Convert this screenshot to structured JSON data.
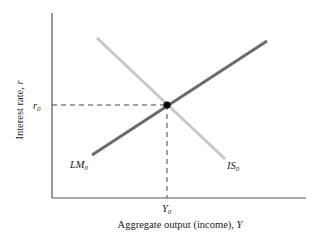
{
  "diagram": {
    "type": "IS-LM model",
    "axes": {
      "x_label": "Aggregate output (income), ",
      "x_label_var": "Y",
      "y_label": "Interest rate, ",
      "y_label_var": "r"
    },
    "curves": [
      {
        "name": "LM",
        "subscript": "0",
        "slope": "upward",
        "color": "#6b6b6b"
      },
      {
        "name": "IS",
        "subscript": "0",
        "slope": "downward",
        "color": "#c8c8c8"
      }
    ],
    "equilibrium": {
      "r_label": "r",
      "r_sub": "0",
      "y_label": "Y",
      "y_sub": "0"
    }
  },
  "colors": {
    "axis": "#555555",
    "lm_curve": "#6b6b6b",
    "is_curve": "#c8c8c8",
    "equilibrium_point": "#000000",
    "guide_lines": "#444444"
  }
}
